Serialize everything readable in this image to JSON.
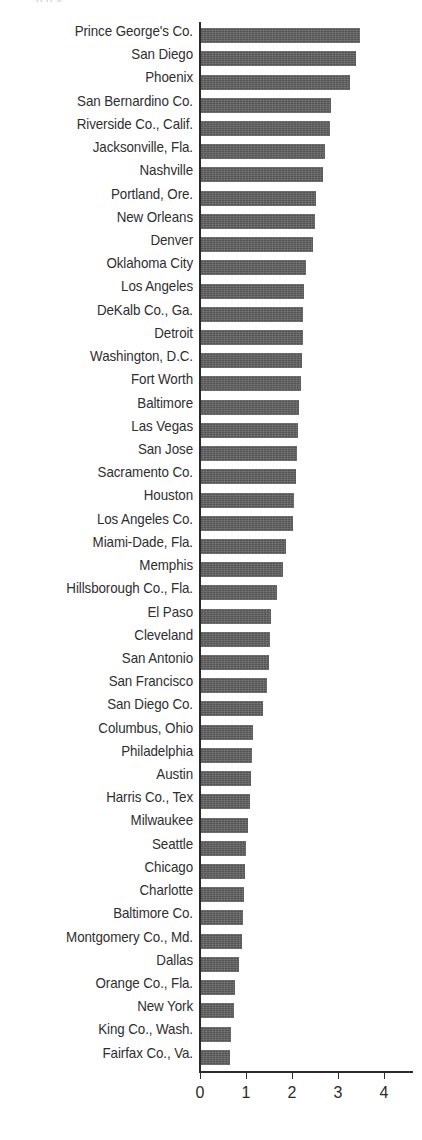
{
  "top_sliver_text": "p          g  y",
  "colors": {
    "bar_fill": "#5c5c5c",
    "axis": "#2b2b2b",
    "label_text": "#2e2e2e",
    "background": "#ffffff"
  },
  "chart_data": {
    "type": "bar",
    "orientation": "horizontal",
    "title": "",
    "subtitle": "",
    "xlabel": "",
    "ylabel": "",
    "xlim": [
      0,
      4.65
    ],
    "xticks": [
      0,
      1,
      2,
      3,
      4
    ],
    "xtick_labels": [
      "0",
      "1",
      "2",
      "3",
      "4"
    ],
    "grid": false,
    "legend": null,
    "sorted": "descending",
    "categories": [
      "Prince George's Co.",
      "San Diego",
      "Phoenix",
      "San Bernardino Co.",
      "Riverside Co., Calif.",
      "Jacksonville, Fla.",
      "Nashville",
      "Portland, Ore.",
      "New Orleans",
      "Denver",
      "Oklahoma City",
      "Los Angeles",
      "DeKalb Co., Ga.",
      "Detroit",
      "Washington, D.C.",
      "Fort Worth",
      "Baltimore",
      "Las Vegas",
      "San Jose",
      "Sacramento Co.",
      "Houston",
      "Los Angeles Co.",
      "Miami-Dade, Fla.",
      "Memphis",
      "Hillsborough Co., Fla.",
      "El Paso",
      "Cleveland",
      "San Antonio",
      "San Francisco",
      "San Diego Co.",
      "Columbus, Ohio",
      "Philadelphia",
      "Austin",
      "Harris Co., Tex",
      "Milwaukee",
      "Seattle",
      "Chicago",
      "Charlotte",
      "Baltimore Co.",
      "Montgomery Co., Md.",
      "Dallas",
      "Orange Co., Fla.",
      "New York",
      "King Co., Wash.",
      "Fairfax Co., Va."
    ],
    "values": [
      3.48,
      3.39,
      3.26,
      2.85,
      2.83,
      2.72,
      2.68,
      2.52,
      2.5,
      2.46,
      2.3,
      2.26,
      2.24,
      2.24,
      2.22,
      2.2,
      2.15,
      2.13,
      2.11,
      2.09,
      2.04,
      2.02,
      1.87,
      1.8,
      1.67,
      1.54,
      1.52,
      1.5,
      1.46,
      1.37,
      1.15,
      1.13,
      1.11,
      1.09,
      1.04,
      1.0,
      0.98,
      0.95,
      0.93,
      0.91,
      0.85,
      0.76,
      0.74,
      0.67,
      0.65
    ]
  }
}
